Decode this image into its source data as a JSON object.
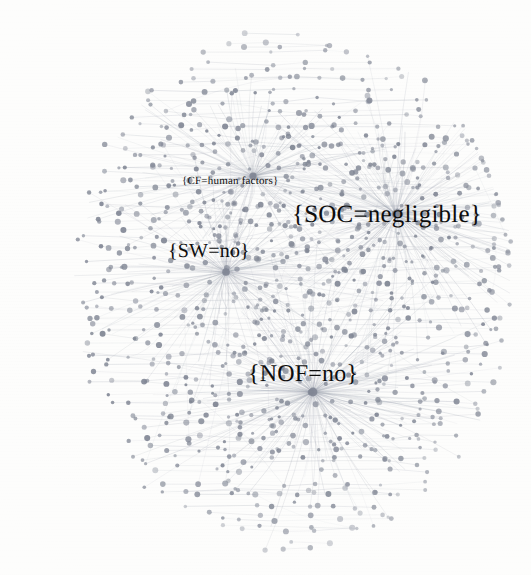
{
  "figure": {
    "kind": "network-graph",
    "background_color": "#fdfdfc",
    "node_color": "#7f8593",
    "edge_color": "#9aa0ad",
    "label_color": "#0d0d0d",
    "width": 531,
    "height": 575
  },
  "chart_data": {
    "type": "scatter",
    "title": "",
    "xlabel": "",
    "ylabel": "",
    "grid": false,
    "legend_position": "none",
    "hubs": [
      {
        "id": "cf-human-factors",
        "label": "{CF=human factors}",
        "x": 253,
        "y": 176,
        "radius": 3.6,
        "font_size": 11,
        "label_x": 182,
        "label_y": 176,
        "degree": 150,
        "spoke_spread_deg": [
          95,
          430
        ],
        "spoke_len": [
          34,
          150
        ]
      },
      {
        "id": "soc-negligible",
        "label": "{SOC=negligible}",
        "x": 396,
        "y": 214,
        "radius": 4.2,
        "font_size": 25,
        "label_x": 292,
        "label_y": 202,
        "degree": 220,
        "spoke_spread_deg": [
          110,
          470
        ],
        "spoke_len": [
          40,
          190
        ]
      },
      {
        "id": "sw-no",
        "label": "{SW=no}",
        "x": 226,
        "y": 272,
        "radius": 3.8,
        "font_size": 20,
        "label_x": 168,
        "label_y": 241,
        "degree": 165,
        "spoke_spread_deg": [
          60,
          420
        ],
        "spoke_len": [
          36,
          165
        ]
      },
      {
        "id": "nof-no",
        "label": "{NOF=no}",
        "x": 313,
        "y": 392,
        "radius": 4.4,
        "font_size": 24,
        "label_x": 248,
        "label_y": 362,
        "degree": 235,
        "spoke_spread_deg": [
          200,
          560
        ],
        "spoke_len": [
          40,
          200
        ]
      }
    ],
    "peripheral_node_count": 640,
    "edge_count": 1180,
    "cloud_center": [
      292,
      288
    ],
    "cloud_radius": [
      218,
      262
    ]
  },
  "labels": {
    "cf": "{CF=human factors}",
    "soc": "{SOC=negligible}",
    "sw": "{SW=no}",
    "nof": "{NOF=no}"
  }
}
